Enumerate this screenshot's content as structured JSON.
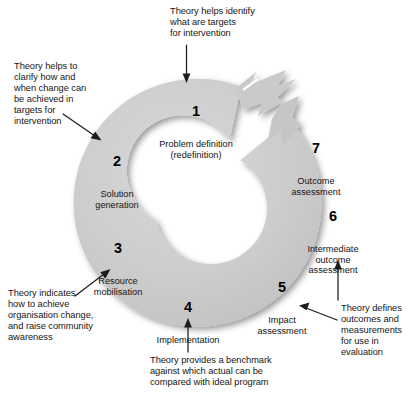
{
  "figure": {
    "type": "cyclical-process-diagram",
    "shape": "donut-with-arrowhead",
    "colors": {
      "ring_fill": "#c9c9c9",
      "ring_fill_light": "#d6d6d6",
      "background": "#ffffff",
      "text": "#141414",
      "arrow": "#1a1a1a"
    }
  },
  "steps": [
    {
      "number": "1",
      "label": "Problem definition\n(redefinition)"
    },
    {
      "number": "2",
      "label": "Solution\ngeneration"
    },
    {
      "number": "3",
      "label": "Resource\nmobilisation"
    },
    {
      "number": "4",
      "label": "Implementation"
    },
    {
      "number": "5",
      "label": "Impact\nassessment"
    },
    {
      "number": "6",
      "label": "Intermediate\noutcome\nassessment"
    },
    {
      "number": "7",
      "label": "Outcome\nassessment"
    }
  ],
  "captions": [
    {
      "id": "top",
      "text": "Theory helps identify\nwhat are targets\nfor intervention"
    },
    {
      "id": "left-upper",
      "text": "Theory helps to\nclarify how and\nwhen change can\nbe achieved in\ntargets for\nintervention"
    },
    {
      "id": "left-lower",
      "text": "Theory indicates\nhow to achieve\norganisation change,\nand raise community\nawareness"
    },
    {
      "id": "bottom",
      "text": "Theory provides a benchmark\nagainst which actual can be\ncompared with ideal program"
    },
    {
      "id": "right-lower",
      "text": "Theory defines\noutcomes and\nmeasurements\nfor use in\nevaluation"
    }
  ]
}
